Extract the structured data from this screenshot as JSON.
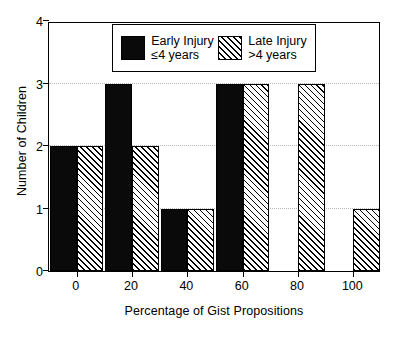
{
  "chart_data": {
    "type": "bar",
    "title": "",
    "xlabel": "Percentage of Gist Propositions",
    "ylabel": "Number of Children",
    "categories": [
      "0",
      "20",
      "40",
      "60",
      "80",
      "100"
    ],
    "xtick_labels": [
      "0",
      "20",
      "40",
      "60",
      "80",
      "100"
    ],
    "ytick_labels": [
      "0",
      "1",
      "2",
      "3",
      "4"
    ],
    "xlim": [
      -10,
      110
    ],
    "ylim": [
      0,
      4
    ],
    "grid": "horizontal-dotted",
    "legend_position": "upper-center-inside",
    "series": [
      {
        "name": "Early Injury",
        "sublabel": "≤4 years",
        "fill": "solid-black",
        "color": "#0a0a0a",
        "values": [
          2,
          3,
          1,
          3,
          0,
          0
        ]
      },
      {
        "name": "Late Injury",
        "sublabel": ">4 years",
        "fill": "diagonal-hatch",
        "color": "#ffffff",
        "values": [
          2,
          2,
          1,
          3,
          3,
          1
        ]
      }
    ]
  },
  "axes": {
    "y_title": "Number of Children",
    "x_title": "Percentage of Gist Propositions",
    "y_ticks": [
      "0",
      "1",
      "2",
      "3",
      "4"
    ],
    "x_ticks": [
      "0",
      "20",
      "40",
      "60",
      "80",
      "100"
    ]
  },
  "legend": {
    "items": [
      {
        "name": "Early Injury",
        "sub": "≤4 years",
        "swatch": "solid-black-swatch"
      },
      {
        "name": "Late Injury",
        "sub": ">4 years",
        "swatch": "diagonal-hatch-swatch"
      }
    ]
  },
  "colors": {
    "series_early": "#0a0a0a",
    "series_late": "#ffffff",
    "axis": "#000000",
    "grid": "#b9b9b9",
    "background": "#ffffff"
  }
}
